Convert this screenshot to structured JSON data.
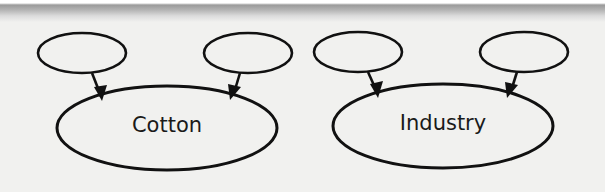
{
  "diagram": {
    "colors": {
      "background": "#f1f1ef",
      "stroke": "#111111",
      "text": "#1a1a1a"
    },
    "groups": [
      {
        "main_node": {
          "label": "Cotton",
          "cx": 167,
          "cy": 128,
          "rx": 110,
          "ry": 42
        },
        "input_nodes": [
          {
            "label": "",
            "cx": 82,
            "cy": 53,
            "rx": 44,
            "ry": 20
          },
          {
            "label": "",
            "cx": 248,
            "cy": 53,
            "rx": 44,
            "ry": 20
          }
        ]
      },
      {
        "main_node": {
          "label": "Industry",
          "cx": 443,
          "cy": 126,
          "rx": 110,
          "ry": 42
        },
        "input_nodes": [
          {
            "label": "",
            "cx": 358,
            "cy": 52,
            "rx": 44,
            "ry": 20
          },
          {
            "label": "",
            "cx": 524,
            "cy": 52,
            "rx": 44,
            "ry": 20
          }
        ]
      }
    ]
  }
}
